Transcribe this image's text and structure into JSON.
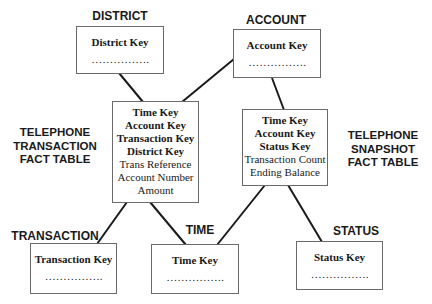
{
  "diagram": {
    "type": "star-schema",
    "line_color": "#1a1a1a",
    "dimensions": {
      "district": {
        "title": "DISTRICT",
        "key": "District Key",
        "dots": "……………."
      },
      "account": {
        "title": "ACCOUNT",
        "key": "Account Key",
        "dots": "……………."
      },
      "transaction": {
        "title": "TRANSACTION",
        "key": "Transaction Key",
        "dots": "……………."
      },
      "time": {
        "title": "TIME",
        "key": "Time Key",
        "dots": "……………."
      },
      "status": {
        "title": "STATUS",
        "key": "Status Key",
        "dots": "……………."
      }
    },
    "facts": {
      "transaction_fact": {
        "label": [
          "TELEPHONE",
          "TRANSACTION",
          "FACT TABLE"
        ],
        "fields": [
          "Time Key",
          "Account Key",
          "Transaction Key",
          "District Key",
          "Trans Reference",
          "Account Number",
          "Amount"
        ]
      },
      "snapshot_fact": {
        "label": [
          "TELEPHONE",
          "SNAPSHOT",
          "FACT TABLE"
        ],
        "fields": [
          "Time Key",
          "Account Key",
          "Status Key",
          "Transaction Count",
          "Ending Balance"
        ]
      }
    },
    "connections": [
      {
        "from": "district",
        "to": "transaction_fact"
      },
      {
        "from": "account",
        "to": "transaction_fact"
      },
      {
        "from": "account",
        "to": "snapshot_fact"
      },
      {
        "from": "transaction_fact",
        "to": "transaction"
      },
      {
        "from": "transaction_fact",
        "to": "time"
      },
      {
        "from": "snapshot_fact",
        "to": "time"
      },
      {
        "from": "snapshot_fact",
        "to": "status"
      }
    ]
  }
}
